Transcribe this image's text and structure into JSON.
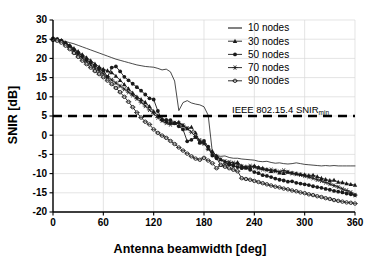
{
  "chart_data": {
    "type": "line",
    "title": "",
    "xlabel": "Antenna beamwidth [deg]",
    "ylabel": "SNIR  [dB]",
    "xlim": [
      0,
      360
    ],
    "ylim": [
      -20,
      30
    ],
    "xticks": [
      0,
      60,
      120,
      180,
      240,
      300,
      360
    ],
    "yticks": [
      -20,
      -15,
      -10,
      -5,
      0,
      5,
      10,
      15,
      20,
      25,
      30
    ],
    "xtick_labels": [
      "0",
      "60",
      "120",
      "180",
      "240",
      "300",
      "360"
    ],
    "ytick_labels": [
      "-20",
      "-15",
      "-10",
      "-5",
      "0",
      "5",
      "10",
      "15",
      "20",
      "25",
      "30"
    ],
    "grid": true,
    "legend_position": "upper-right",
    "legend_entries": [
      {
        "label": "10 nodes",
        "marker": "none"
      },
      {
        "label": "30 nodes",
        "marker": "triangle"
      },
      {
        "label": "50 nodes",
        "marker": "circle-filled"
      },
      {
        "label": "70 nodes",
        "marker": "asterisk"
      },
      {
        "label": "90 nodes",
        "marker": "circle-small"
      }
    ],
    "annotations": [
      {
        "name": "snir-min-threshold",
        "text": "IEEE 802.15.4 SNIR",
        "subscript": "min",
        "y_value": 5,
        "style": "dashed-horizontal-line"
      }
    ],
    "series": [
      {
        "name": "10 nodes",
        "marker": "none",
        "x": [
          0,
          5,
          10,
          15,
          20,
          25,
          30,
          35,
          40,
          45,
          50,
          55,
          60,
          65,
          70,
          75,
          80,
          85,
          90,
          95,
          100,
          105,
          110,
          115,
          120,
          125,
          130,
          135,
          140,
          145,
          150,
          155,
          160,
          165,
          170,
          175,
          180,
          185,
          190,
          195,
          200,
          205,
          210,
          215,
          220,
          225,
          230,
          235,
          240,
          245,
          250,
          255,
          260,
          265,
          270,
          275,
          280,
          285,
          290,
          295,
          300,
          305,
          310,
          315,
          320,
          325,
          330,
          335,
          340,
          345,
          350,
          355,
          360
        ],
        "y": [
          24.9,
          24.9,
          24.7,
          24.4,
          24.1,
          23.8,
          23.4,
          23.0,
          22.6,
          22.2,
          21.8,
          21.4,
          21.0,
          20.6,
          20.2,
          19.8,
          19.5,
          19.2,
          18.9,
          18.6,
          18.3,
          18.1,
          17.9,
          17.8,
          17.7,
          17.4,
          17.0,
          17.2,
          16.5,
          14.1,
          6.4,
          8.5,
          9.0,
          8.4,
          8.1,
          7.9,
          7.4,
          5.2,
          -4.5,
          -5.3,
          -5.5,
          -5.4,
          -5.8,
          -6.0,
          -6.0,
          -6.2,
          -6.3,
          -6.4,
          -6.5,
          -6.8,
          -6.9,
          -6.8,
          -7.1,
          -7.3,
          -7.2,
          -7.4,
          -7.5,
          -7.4,
          -7.2,
          -7.4,
          -7.6,
          -7.7,
          -7.8,
          -7.9,
          -8.0,
          -7.9,
          -8.0,
          -7.9,
          -8.0,
          -8.0,
          -8.0,
          -8.0,
          -8.0
        ]
      },
      {
        "name": "30 nodes",
        "marker": "triangle",
        "x": [
          0,
          5,
          10,
          15,
          20,
          25,
          30,
          35,
          40,
          45,
          50,
          55,
          60,
          65,
          70,
          75,
          80,
          85,
          90,
          95,
          100,
          105,
          110,
          115,
          120,
          125,
          130,
          135,
          140,
          145,
          150,
          155,
          160,
          165,
          170,
          175,
          180,
          185,
          190,
          195,
          200,
          205,
          210,
          215,
          220,
          225,
          230,
          235,
          240,
          245,
          250,
          255,
          260,
          265,
          270,
          275,
          280,
          285,
          290,
          295,
          300,
          305,
          310,
          315,
          320,
          325,
          330,
          335,
          340,
          345,
          350,
          355,
          360
        ],
        "y": [
          25.1,
          25.0,
          24.7,
          24.1,
          23.4,
          22.6,
          21.8,
          21.0,
          20.2,
          19.4,
          18.6,
          17.8,
          17.2,
          16.8,
          16.3,
          15.4,
          14.3,
          13.2,
          12.1,
          11.0,
          10.0,
          9.3,
          8.6,
          7.5,
          6.2,
          5.1,
          4.3,
          3.6,
          3.3,
          3.2,
          3.4,
          2.5,
          1.7,
          2.1,
          0.6,
          -1.8,
          -2.0,
          -3.5,
          -4.2,
          -5.4,
          -6.3,
          -7.0,
          -7.6,
          -7.6,
          -7.1,
          -8.0,
          -8.2,
          -8.4,
          -8.0,
          -8.4,
          -8.6,
          -8.9,
          -9.4,
          -9.2,
          -9.8,
          -9.9,
          -9.6,
          -9.8,
          -10.0,
          -10.2,
          -10.3,
          -10.5,
          -10.4,
          -10.8,
          -11.2,
          -11.5,
          -11.8,
          -11.7,
          -12.2,
          -12.3,
          -12.6,
          -12.8,
          -13.0
        ]
      },
      {
        "name": "50 nodes",
        "marker": "circle-filled",
        "x": [
          0,
          5,
          10,
          15,
          20,
          25,
          30,
          35,
          40,
          45,
          50,
          55,
          60,
          65,
          70,
          75,
          80,
          85,
          90,
          95,
          100,
          105,
          110,
          115,
          120,
          125,
          130,
          135,
          140,
          145,
          150,
          155,
          160,
          165,
          170,
          175,
          180,
          185,
          190,
          195,
          200,
          205,
          210,
          215,
          220,
          225,
          230,
          235,
          240,
          245,
          250,
          255,
          260,
          265,
          270,
          275,
          280,
          285,
          290,
          295,
          300,
          305,
          310,
          315,
          320,
          325,
          330,
          335,
          340,
          345,
          350,
          355,
          360
        ],
        "y": [
          25.2,
          25.0,
          24.6,
          24.0,
          23.2,
          22.3,
          21.5,
          20.6,
          19.7,
          18.9,
          18.1,
          17.4,
          16.8,
          15.2,
          17.6,
          17.9,
          16.6,
          15.2,
          14.3,
          13.4,
          12.5,
          11.6,
          10.6,
          9.6,
          9.3,
          6.3,
          4.0,
          4.0,
          3.9,
          3.1,
          2.3,
          1.5,
          -1.6,
          -1.2,
          -0.5,
          -2.0,
          -1.5,
          -3.0,
          -5.3,
          -6.0,
          -7.8,
          -8.0,
          -7.4,
          -8.0,
          -8.3,
          -8.6,
          -8.5,
          -9.0,
          -9.6,
          -9.9,
          -10.4,
          -10.6,
          -10.9,
          -11.3,
          -11.6,
          -11.8,
          -12.1,
          -12.0,
          -12.4,
          -12.6,
          -12.8,
          -13.0,
          -13.3,
          -13.5,
          -13.7,
          -14.0,
          -14.2,
          -14.5,
          -14.7,
          -14.9,
          -15.2,
          -15.4,
          -15.6
        ]
      },
      {
        "name": "70 nodes",
        "marker": "asterisk",
        "x": [
          0,
          5,
          10,
          15,
          20,
          25,
          30,
          35,
          40,
          45,
          50,
          55,
          60,
          65,
          70,
          75,
          80,
          85,
          90,
          95,
          100,
          105,
          110,
          115,
          120,
          125,
          130,
          135,
          140,
          145,
          150,
          155,
          160,
          165,
          170,
          175,
          180,
          185,
          190,
          195,
          200,
          205,
          210,
          215,
          220,
          225,
          230,
          235,
          240,
          245,
          250,
          255,
          260,
          265,
          270,
          275,
          280,
          285,
          290,
          295,
          300,
          305,
          310,
          315,
          320,
          325,
          330,
          335,
          340,
          345,
          350,
          355,
          360
        ],
        "y": [
          25.0,
          24.8,
          24.3,
          23.6,
          22.8,
          21.9,
          21.0,
          20.1,
          19.2,
          18.3,
          17.5,
          16.8,
          16.0,
          15.2,
          14.4,
          13.6,
          12.8,
          12.0,
          11.2,
          10.4,
          9.5,
          8.6,
          7.6,
          6.6,
          5.6,
          4.6,
          3.8,
          3.2,
          2.8,
          3.2,
          3.0,
          2.6,
          1.8,
          0.8,
          -0.4,
          -1.3,
          -2.2,
          -3.6,
          -4.9,
          -5.6,
          -6.4,
          -6.8,
          -7.0,
          -7.2,
          -7.5,
          -8.2,
          -8.5,
          -8.0,
          -8.3,
          -8.6,
          -8.9,
          -9.1,
          -9.0,
          -9.3,
          -9.5,
          -9.2,
          -9.6,
          -9.9,
          -10.1,
          -10.3,
          -10.6,
          -10.9,
          -11.2,
          -11.6,
          -11.9,
          -12.3,
          -12.7,
          -13.1,
          -13.5,
          -14.0,
          -14.4,
          -14.9,
          -15.6
        ]
      },
      {
        "name": "90 nodes",
        "marker": "circle-small",
        "x": [
          0,
          5,
          10,
          15,
          20,
          25,
          30,
          35,
          40,
          45,
          50,
          55,
          60,
          65,
          70,
          75,
          80,
          85,
          90,
          95,
          100,
          105,
          110,
          115,
          120,
          125,
          130,
          135,
          140,
          145,
          150,
          155,
          160,
          165,
          170,
          175,
          180,
          185,
          190,
          195,
          200,
          205,
          210,
          215,
          220,
          225,
          230,
          235,
          240,
          245,
          250,
          255,
          260,
          265,
          270,
          275,
          280,
          285,
          290,
          295,
          300,
          305,
          310,
          315,
          320,
          325,
          330,
          335,
          340,
          345,
          350,
          355,
          360
        ],
        "y": [
          24.8,
          24.6,
          24.1,
          23.3,
          22.4,
          21.4,
          20.4,
          19.4,
          18.5,
          17.6,
          16.7,
          15.9,
          15.1,
          14.2,
          13.3,
          12.3,
          11.2,
          10.0,
          8.7,
          7.3,
          5.9,
          4.6,
          3.5,
          2.8,
          1.5,
          0.6,
          -0.1,
          -0.7,
          -1.5,
          -2.3,
          -3.2,
          -4.0,
          -4.8,
          -5.5,
          -6.1,
          -6.4,
          -5.9,
          -6.6,
          -7.3,
          -8.6,
          -7.7,
          -8.2,
          -8.6,
          -9.0,
          -9.4,
          -11.2,
          -11.4,
          -11.6,
          -11.9,
          -12.2,
          -12.5,
          -12.8,
          -13.1,
          -13.4,
          -13.6,
          -13.9,
          -14.1,
          -14.4,
          -14.6,
          -14.9,
          -15.1,
          -15.4,
          -15.6,
          -15.9,
          -16.1,
          -16.4,
          -16.6,
          -16.9,
          -17.1,
          -17.3,
          -17.5,
          -17.6,
          -17.8
        ]
      }
    ],
    "colors": {
      "line": "#1a1a1a",
      "grid": "#d9d9d9",
      "axis": "#000000",
      "background": "#ffffff"
    }
  }
}
